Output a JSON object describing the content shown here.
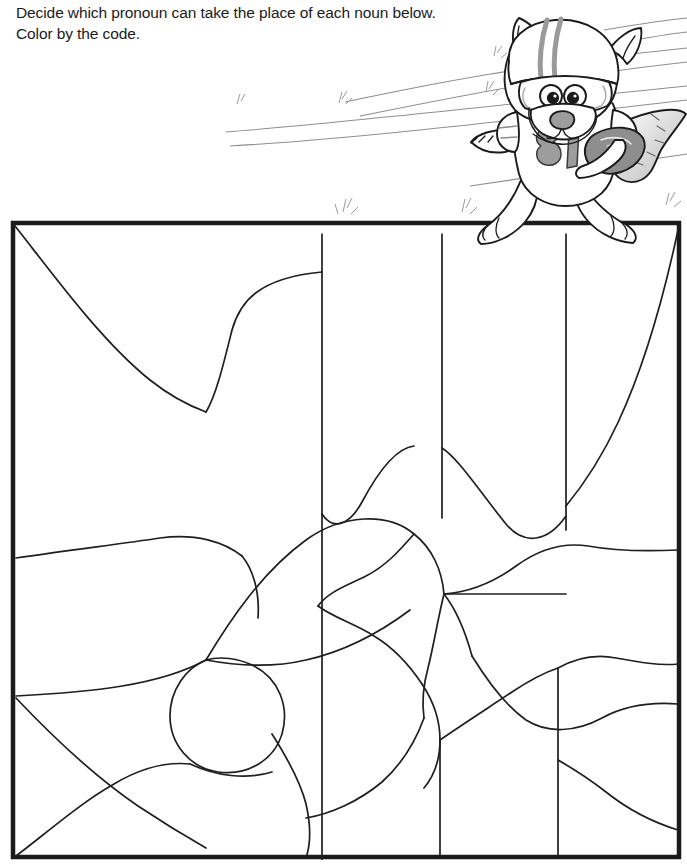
{
  "worksheet": {
    "instructions": [
      "Decide which pronoun can take the place of each noun below.",
      "Color by the code."
    ],
    "color_code": {
      "title": "Color Code",
      "equals": "=",
      "entries": [
        {
          "pronoun": "she",
          "color": "green"
        },
        {
          "pronoun": "he",
          "color": "brown"
        },
        {
          "pronoun": "it",
          "color": "yellow"
        },
        {
          "pronoun": "they",
          "color": "blue"
        }
      ]
    },
    "mascot": {
      "name": "raccoon-football-player",
      "jersey_number": "81"
    },
    "puzzle": {
      "regions": [
        {
          "label": "cheerleaders",
          "x": 193,
          "y": 72
        },
        {
          "label": "dog",
          "x": 370,
          "y": 58
        },
        {
          "label": "girls",
          "x": 500,
          "y": 58
        },
        {
          "label": "house",
          "x": 605,
          "y": 60
        },
        {
          "label": "children",
          "x": 86,
          "y": 200
        },
        {
          "label": "singers",
          "x": 261,
          "y": 230
        },
        {
          "label": "ball",
          "x": 370,
          "y": 231
        },
        {
          "label": "friends",
          "x": 497,
          "y": 231
        },
        {
          "label": "hot dog",
          "x": 623,
          "y": 232
        },
        {
          "label": "Boy Scouts",
          "x": 86,
          "y": 337
        },
        {
          "label": "John",
          "x": 311,
          "y": 338
        },
        {
          "label": "Mr. Jones",
          "x": 388,
          "y": 395
        },
        {
          "label": "school",
          "x": 606,
          "y": 373
        },
        {
          "label": "Debbie",
          "x": 108,
          "y": 446
        },
        {
          "label": "Dad",
          "x": 310,
          "y": 452
        },
        {
          "label": "book",
          "x": 489,
          "y": 432
        },
        {
          "label": "brother",
          "x": 214,
          "y": 494
        },
        {
          "label": "Mrs. Smith",
          "x": 614,
          "y": 519
        },
        {
          "label": "aunt",
          "x": 52,
          "y": 527
        },
        {
          "label": "mother",
          "x": 355,
          "y": 581
        },
        {
          "label": "ruler",
          "x": 490,
          "y": 584
        },
        {
          "label": "Mrs. Brown",
          "x": 167,
          "y": 597
        },
        {
          "label": "Granny",
          "x": 610,
          "y": 620
        }
      ]
    }
  }
}
